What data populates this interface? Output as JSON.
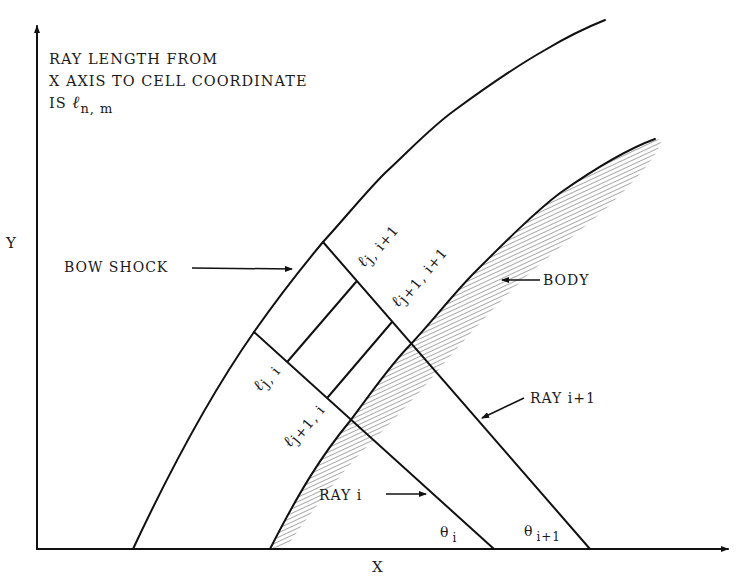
{
  "figure": {
    "note": {
      "line1": "RAY LENGTH FROM",
      "line2": "X AXIS TO CELL COORDINATE",
      "line3_prefix": "IS ",
      "line3_symbol": "ℓ",
      "line3_subscript": "n, m"
    },
    "axes": {
      "x_label": "X",
      "y_label": "Y"
    },
    "callouts": {
      "bow_shock": "BOW SHOCK",
      "body": "BODY",
      "ray_i": "RAY i",
      "ray_i1": "RAY i+1"
    },
    "cell_labels": {
      "l_j_i1": {
        "symbol": "ℓ",
        "sub": "j, i+1"
      },
      "l_j1_i1": {
        "symbol": "ℓ",
        "sub": "j+1, i+1"
      },
      "l_j_i": {
        "symbol": "ℓ",
        "sub": "j, i"
      },
      "l_j1_i": {
        "symbol": "ℓ",
        "sub": "j+1, i"
      }
    },
    "angles": {
      "theta_i": {
        "symbol": "θ",
        "sub": "i"
      },
      "theta_i1": {
        "symbol": "θ",
        "sub": "i+1"
      }
    },
    "colors": {
      "ink": "#111111",
      "hatch": "#555555",
      "background": "#ffffff"
    }
  }
}
